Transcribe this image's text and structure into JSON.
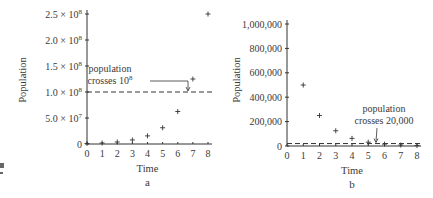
{
  "chart_data": [
    {
      "type": "scatter",
      "panel_label": "a",
      "title": "",
      "xlabel": "Time",
      "ylabel": "Population",
      "x_ticks": [
        "0",
        "1",
        "2",
        "3",
        "4",
        "5",
        "6",
        "7",
        "8"
      ],
      "y_ticks": [
        "0",
        "5.0 × 10^7",
        "1.0 × 10^8",
        "1.5 × 10^8",
        "2.0 × 10^8",
        "2.5 × 10^8"
      ],
      "y_tick_values": [
        0,
        50000000,
        100000000,
        150000000,
        200000000,
        250000000
      ],
      "xlim": [
        0,
        8
      ],
      "ylim": [
        0,
        250000000
      ],
      "grid": false,
      "marker": "+",
      "x": [
        0,
        1,
        2,
        3,
        4,
        5,
        6,
        7,
        8
      ],
      "values": [
        976563,
        1953125,
        3906250,
        7812500,
        15625000,
        31250000,
        62500000,
        125000000,
        250000000
      ],
      "threshold_line": {
        "y": 100000000,
        "style": "dashed"
      },
      "annotation": {
        "line1": "population",
        "line2": "crosses 10",
        "sup": "8"
      }
    },
    {
      "type": "scatter",
      "panel_label": "b",
      "title": "",
      "xlabel": "Time",
      "ylabel": "Population",
      "x_ticks": [
        "0",
        "1",
        "2",
        "3",
        "4",
        "5",
        "6",
        "7",
        "8"
      ],
      "y_ticks": [
        "0",
        "200,000",
        "400,000",
        "600,000",
        "800,000",
        "1,000,000"
      ],
      "y_tick_values": [
        0,
        200000,
        400000,
        600000,
        800000,
        1000000
      ],
      "xlim": [
        0,
        8
      ],
      "ylim": [
        0,
        1000000
      ],
      "grid": false,
      "marker": "+",
      "x": [
        1,
        2,
        3,
        4,
        5,
        6,
        7,
        8
      ],
      "values": [
        500000,
        250000,
        125000,
        62500,
        31250,
        15625,
        7813,
        3906
      ],
      "threshold_line": {
        "y": 20000,
        "style": "dashed"
      },
      "annotation": {
        "line1": "population",
        "line2": "crosses 20,000"
      }
    }
  ]
}
